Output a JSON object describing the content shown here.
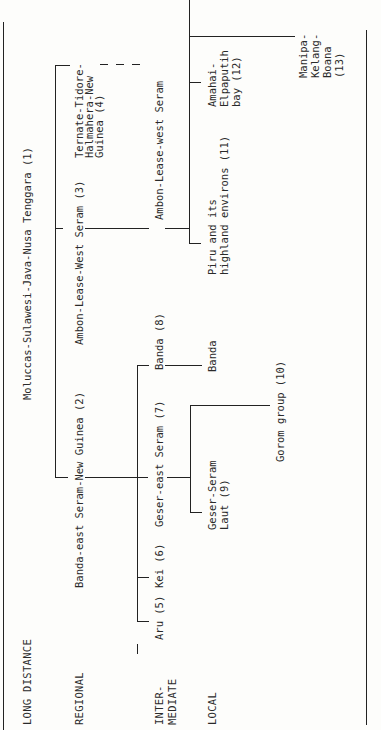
{
  "levels": {
    "long_distance": "LONG DISTANCE",
    "regional": "REGIONAL",
    "intermediate_1": "INTER-",
    "intermediate_2": "MEDIATE",
    "local": "LOCAL"
  },
  "nodes": {
    "n1": "Moluccas-Sulawesi-Java-Nusa Tenggara (1)",
    "n2": "Banda-east Seram-New Guinea (2)",
    "n3": "Ambon-Lease-West Seram (3)",
    "n4_1": "Ternate-Tidore-",
    "n4_2": "Halmahera-New",
    "n4_3": "Guinea (4)",
    "n5": "Aru (5)",
    "n6": "Kei (6)",
    "n7": "Geser-east Seram (7)",
    "n8": "Banda (8)",
    "n9_1": "Geser-Seram",
    "n9_2": "Laut (9)",
    "n10": "Gorom group (10)",
    "banda_local": "Banda",
    "ambon_inter": "Ambon-Lease-west Seram",
    "n11_1": "Piru and its",
    "n11_2": "highland environs (11)",
    "n12_1": "Amahai-",
    "n12_2": "Elpaputih",
    "n12_3": "bay (12)",
    "n13_1": "Manipa-",
    "n13_2": "Kelang-",
    "n13_3": "Boana",
    "n13_4": "(13)"
  },
  "style": {
    "line_color": "#222222",
    "text_color": "#2a2a2a",
    "background": "#fdfdfb"
  }
}
